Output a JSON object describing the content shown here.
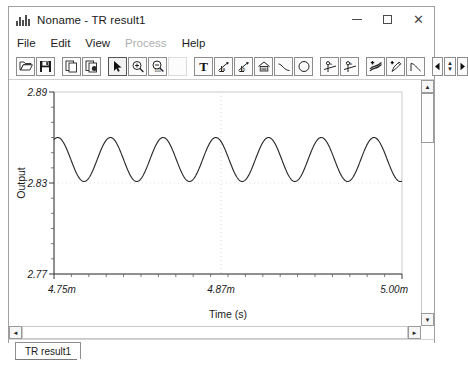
{
  "window": {
    "title": "Noname - TR result1",
    "icon": "chart-bars-icon",
    "controls": {
      "minimize": "–",
      "maximize": "□",
      "close": "✕"
    }
  },
  "menu": {
    "items": [
      {
        "label": "File",
        "disabled": false
      },
      {
        "label": "Edit",
        "disabled": false
      },
      {
        "label": "View",
        "disabled": false
      },
      {
        "label": "Process",
        "disabled": true
      },
      {
        "label": "Help",
        "disabled": false
      }
    ]
  },
  "toolbar": {
    "buttons": [
      {
        "name": "open-icon",
        "tip": "Open"
      },
      {
        "name": "save-icon",
        "tip": "Save"
      },
      {
        "name": "copy-icon",
        "tip": "Copy"
      },
      {
        "name": "paste-icon",
        "tip": "Paste"
      },
      {
        "name": "pointer-icon",
        "tip": "Select"
      },
      {
        "name": "zoom-in-icon",
        "tip": "Zoom In"
      },
      {
        "name": "zoom-out-100-icon",
        "tip": "Zoom 100%"
      },
      {
        "name": "text-icon",
        "tip": "Text"
      },
      {
        "name": "cursor-measure-a-icon",
        "tip": "Cursor A"
      },
      {
        "name": "cursor-measure-b-icon",
        "tip": "Cursor B"
      },
      {
        "name": "axis-scale-icon",
        "tip": "Axis"
      },
      {
        "name": "line-icon",
        "tip": "Line"
      },
      {
        "name": "ellipse-icon",
        "tip": "Ellipse"
      },
      {
        "name": "marker-a-icon",
        "tip": "Marker a"
      },
      {
        "name": "marker-b-icon",
        "tip": "Marker b"
      },
      {
        "name": "add-trace-icon",
        "tip": "Add Trace"
      },
      {
        "name": "add-probe-icon",
        "tip": "Add Probe"
      },
      {
        "name": "curve-icon",
        "tip": "Curve"
      },
      {
        "name": "step-prev-icon",
        "tip": "Previous"
      },
      {
        "name": "stepper-icon",
        "tip": "Step"
      },
      {
        "name": "step-next-icon",
        "tip": "Next"
      }
    ],
    "zoom_out_label": "100"
  },
  "scrollbars": {
    "up_arrow": "▲",
    "down_arrow": "▼",
    "left_arrow": "◄",
    "right_arrow": "►"
  },
  "tabs": {
    "items": [
      {
        "label": "TR result1",
        "active": true
      }
    ]
  },
  "chart_data": {
    "type": "line",
    "title": "",
    "xlabel": "Time (s)",
    "ylabel": "Output",
    "xtick_labels": [
      "4.75m",
      "4.87m",
      "5.00m"
    ],
    "xtick_values": [
      0.00475,
      0.00487,
      0.005
    ],
    "ytick_labels": [
      "2.77",
      "2.83",
      "2.89"
    ],
    "ytick_values": [
      2.77,
      2.83,
      2.89
    ],
    "xlim": [
      0.00475,
      0.005
    ],
    "ylim": [
      2.77,
      2.89
    ],
    "grid": true,
    "grid_style": "dotted",
    "legend": null,
    "line_color": "#2b2b2b",
    "series": [
      {
        "name": "Output",
        "waveform": "sine",
        "cycles": 6.6,
        "amplitude": 0.0145,
        "offset": 2.8455,
        "phase_deg": 65,
        "peak_value": 2.86,
        "trough_value": 2.831,
        "start_value": 2.8545,
        "end_value": 2.8555
      }
    ]
  }
}
